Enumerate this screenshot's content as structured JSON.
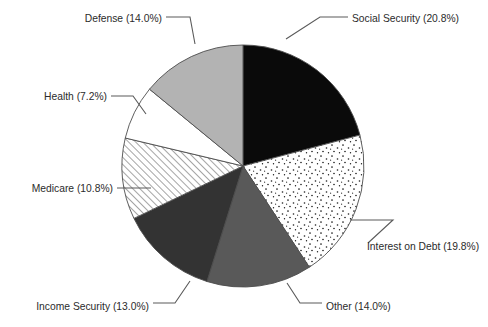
{
  "chart_data": {
    "type": "pie",
    "title": "",
    "subtitle": "",
    "xlabel": "",
    "ylabel": "",
    "legend_position": "none",
    "grid": false,
    "label_format": "{name} ({value}%)",
    "start_angle_deg": 0,
    "direction": "clockwise",
    "categories": [
      "Social Security",
      "Interest on Debt",
      "Other",
      "Income Security",
      "Medicare",
      "Health",
      "Defense"
    ],
    "values": [
      20.8,
      19.8,
      14.0,
      13.0,
      10.8,
      7.2,
      14.0
    ],
    "total": 99.6,
    "slices": [
      {
        "name": "Social Security",
        "value": 20.8,
        "label": "Social Security (20.8%)",
        "fill_style": "solid-black",
        "color": "#0a0a0a",
        "label_anchor": "start",
        "label_x": 352,
        "label_y": 22,
        "leader": "286,39 320,17 348,17"
      },
      {
        "name": "Interest on Debt",
        "value": 19.8,
        "label": "Interest on Debt (19.8%)",
        "fill_style": "dots",
        "color": "#ffffff",
        "label_anchor": "start",
        "label_x": 367,
        "label_y": 250,
        "leader": "350,220 393,220 368,243"
      },
      {
        "name": "Other",
        "value": 14.0,
        "label": "Other (14.0%)",
        "fill_style": "solid",
        "color": "#595959",
        "label_anchor": "start",
        "label_x": 326,
        "label_y": 310,
        "leader": "287,283 300,303 322,303"
      },
      {
        "name": "Income Security",
        "value": 13.0,
        "label": "Income Security (13.0%)",
        "fill_style": "solid",
        "color": "#333333",
        "label_anchor": "end",
        "label_x": 149,
        "label_y": 310,
        "leader": "190,281 175,303 153,303"
      },
      {
        "name": "Medicare",
        "value": 10.8,
        "label": "Medicare (10.8%)",
        "fill_style": "hatch-diagonal",
        "color": "#ffffff",
        "label_anchor": "end",
        "label_x": 113,
        "label_y": 192,
        "leader": "151,188 117,188"
      },
      {
        "name": "Health",
        "value": 7.2,
        "label": "Health (7.2%)",
        "fill_style": "solid",
        "color": "#ffffff",
        "label_anchor": "end",
        "label_x": 107,
        "label_y": 100,
        "leader": "146,114 133,96 111,96"
      },
      {
        "name": "Defense",
        "value": 14.0,
        "label": "Defense (14.0%)",
        "fill_style": "solid",
        "color": "#b3b3b3",
        "label_anchor": "end",
        "label_x": 162,
        "label_y": 22,
        "leader": "195,44 190,17 166,17"
      }
    ],
    "geometry": {
      "center_x": 243,
      "center_y": 166,
      "radius": 121
    }
  }
}
